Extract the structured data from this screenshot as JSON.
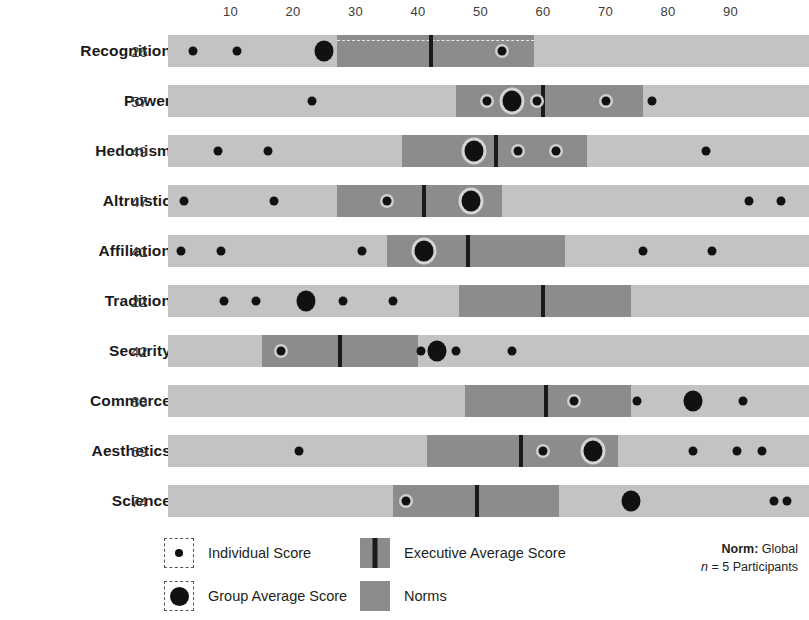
{
  "chart_data": {
    "type": "bar",
    "title": "",
    "xlabel": "",
    "ylabel": "",
    "xlim": [
      0,
      100
    ],
    "grid": false,
    "axis_ticks": [
      10,
      20,
      30,
      40,
      50,
      60,
      70,
      80,
      90
    ],
    "legend_position": "bottom",
    "categories": [
      "Recognition",
      "Power",
      "Hedonism",
      "Altruistic",
      "Affiliation",
      "Tradition",
      "Security",
      "Commerce",
      "Aesthetics",
      "Science"
    ],
    "values": [
      26,
      57,
      49,
      47,
      41,
      22,
      42,
      83,
      69,
      74
    ],
    "series": [
      {
        "name": "Recognition",
        "value": 26,
        "norm_low": 27,
        "norm_high": 58.5,
        "executive_average": 42,
        "group_average": 25,
        "individual_scores": [
          4,
          11,
          53.5
        ]
      },
      {
        "name": "Power",
        "value": 57,
        "norm_low": 46,
        "norm_high": 76,
        "executive_average": 60,
        "group_average": 55,
        "individual_scores": [
          23,
          51,
          59,
          70,
          77.5
        ]
      },
      {
        "name": "Hedonism",
        "value": 49,
        "norm_low": 37.5,
        "norm_high": 67,
        "executive_average": 52.5,
        "group_average": 49,
        "individual_scores": [
          8,
          16,
          56,
          62,
          86
        ]
      },
      {
        "name": "Altruistic",
        "value": 47,
        "norm_low": 27,
        "norm_high": 53.5,
        "executive_average": 41,
        "group_average": 48.5,
        "individual_scores": [
          2.5,
          17,
          35,
          93,
          98
        ]
      },
      {
        "name": "Affiliation",
        "value": 41,
        "norm_low": 35,
        "norm_high": 63.5,
        "executive_average": 48,
        "group_average": 41,
        "individual_scores": [
          2,
          8.5,
          31,
          76,
          87
        ]
      },
      {
        "name": "Tradition",
        "value": 22,
        "norm_low": 46.5,
        "norm_high": 74,
        "executive_average": 60,
        "group_average": 22,
        "individual_scores": [
          9,
          14,
          28,
          36
        ]
      },
      {
        "name": "Security",
        "value": 42,
        "norm_low": 15,
        "norm_high": 40,
        "executive_average": 27.5,
        "group_average": 43,
        "individual_scores": [
          18,
          40.5,
          46,
          55
        ]
      },
      {
        "name": "Commerce",
        "value": 83,
        "norm_low": 47.5,
        "norm_high": 74,
        "executive_average": 60.5,
        "group_average": 84,
        "individual_scores": [
          65,
          75,
          92
        ]
      },
      {
        "name": "Aesthetics",
        "value": 69,
        "norm_low": 41.5,
        "norm_high": 72,
        "executive_average": 56.5,
        "group_average": 68,
        "individual_scores": [
          21,
          60,
          84,
          91,
          95
        ]
      },
      {
        "name": "Science",
        "value": 74,
        "norm_low": 36,
        "norm_high": 62.5,
        "executive_average": 49.5,
        "group_average": 74,
        "individual_scores": [
          38,
          97,
          99
        ]
      }
    ]
  },
  "legend": {
    "individual_score": "Individual Score",
    "group_average_score": "Group Average Score",
    "executive_average_score": "Executive Average Score",
    "norms": "Norms"
  },
  "norm_note": {
    "label": "Norm:",
    "value": "Global",
    "n_prefix": "n",
    "n_value": "= 5 Participants"
  },
  "colors": {
    "track": "#c3c3c3",
    "norm_band": "#8c8c8c",
    "exec_line": "#1a1a1a",
    "dot": "#111111",
    "text": "#231f20"
  }
}
